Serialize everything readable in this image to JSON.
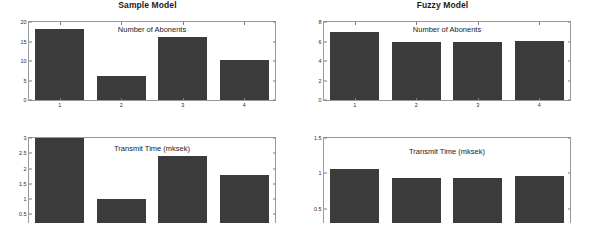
{
  "figure": {
    "background": "#ffffff",
    "bar_color": "#3b3b3b",
    "axis_color": "#9a9a9a"
  },
  "panels": {
    "top_left_title": "Sample Model",
    "top_right_title": "Fuzzy Model"
  },
  "chart_data": [
    {
      "type": "bar",
      "id": "sample-model-abonents",
      "title": "Sample Model",
      "annotation": "Number of Abonents",
      "categories": [
        "1",
        "2",
        "3",
        "4"
      ],
      "values": [
        18.1,
        6.1,
        16.1,
        10.3
      ],
      "xlabel": "",
      "ylabel": "",
      "ylim": [
        0,
        20
      ],
      "yticks": [
        0,
        5,
        10,
        15,
        20
      ],
      "ytick_labels": [
        "0",
        "5",
        "10",
        "15",
        "20"
      ],
      "grid": false,
      "legend": "none"
    },
    {
      "type": "bar",
      "id": "fuzzy-model-abonents",
      "title": "Fuzzy Model",
      "annotation": "Number of Abonents",
      "categories": [
        "1",
        "2",
        "3",
        "4"
      ],
      "values": [
        7.0,
        6.0,
        6.0,
        6.1
      ],
      "xlabel": "",
      "ylabel": "",
      "ylim": [
        0,
        8
      ],
      "yticks": [
        0,
        2,
        4,
        6,
        8
      ],
      "ytick_labels": [
        "0",
        "2",
        "4",
        "6",
        "8"
      ],
      "grid": false,
      "legend": "none"
    },
    {
      "type": "bar",
      "id": "sample-model-transmit-time",
      "title": "",
      "annotation": "Transmit Time (mksek)",
      "categories": [
        "1",
        "2",
        "3",
        "4"
      ],
      "values": [
        3.0,
        1.0,
        2.4,
        1.8
      ],
      "xlabel": "",
      "ylabel": "",
      "ylim": [
        0.22,
        3.0
      ],
      "yticks": [
        0.5,
        1,
        1.5,
        2,
        2.5,
        3
      ],
      "ytick_labels": [
        "0.5",
        "1",
        "1.5",
        "2",
        "2.5",
        "3"
      ],
      "grid": false,
      "legend": "none"
    },
    {
      "type": "bar",
      "id": "fuzzy-model-transmit-time",
      "title": "",
      "annotation": "Transmit Time (mksek)",
      "categories": [
        "1",
        "2",
        "3",
        "4"
      ],
      "values": [
        1.06,
        0.93,
        0.93,
        0.96
      ],
      "xlabel": "",
      "ylabel": "",
      "ylim": [
        0.3,
        1.5
      ],
      "yticks": [
        0.5,
        1,
        1.5
      ],
      "ytick_labels": [
        "0.5",
        "1",
        "1.5"
      ],
      "grid": false,
      "legend": "none"
    }
  ]
}
